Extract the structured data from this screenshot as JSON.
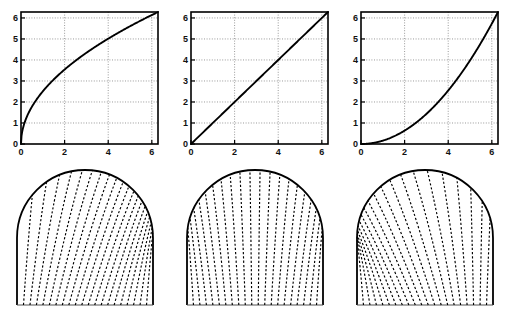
{
  "figure": {
    "title": "",
    "background": "#ffffff",
    "width": 510,
    "height": 323,
    "line_color": "#000000",
    "grid_color": "#808080",
    "axis_color": "#000000"
  },
  "top_row": {
    "panels": [
      {
        "name": "panel-top-left",
        "chart_data": {
          "type": "line",
          "title": "",
          "xlabel": "",
          "ylabel": "",
          "xlim": [
            0,
            6.2832
          ],
          "ylim": [
            0,
            6.2832
          ],
          "xticks": [
            0,
            2,
            4,
            6
          ],
          "yticks": [
            0,
            1,
            2,
            3,
            4,
            5,
            6
          ],
          "xticklabels": [
            "0",
            "2",
            "4",
            "6"
          ],
          "yticklabels": [
            "0",
            "1",
            "2",
            "3",
            "4",
            "5",
            "6"
          ],
          "grid": true,
          "grid_style": "dotted",
          "series": [
            {
              "name": "concave-map",
              "shape": "concave",
              "exponent": 0.5,
              "x": [
                0,
                0.3142,
                0.6283,
                0.9425,
                1.2566,
                1.5708,
                1.885,
                2.1991,
                2.5133,
                2.8274,
                3.1416,
                3.4558,
                3.7699,
                4.0841,
                4.3982,
                4.7124,
                5.0265,
                5.3407,
                5.6549,
                5.969,
                6.2832
              ],
              "y": [
                0,
                1.4,
                1.99,
                2.43,
                2.81,
                3.14,
                3.44,
                3.72,
                3.97,
                4.21,
                4.44,
                4.66,
                4.87,
                5.07,
                5.26,
                5.44,
                5.62,
                5.79,
                5.96,
                6.12,
                6.2832
              ]
            }
          ]
        }
      },
      {
        "name": "panel-top-middle",
        "chart_data": {
          "type": "line",
          "title": "",
          "xlabel": "",
          "ylabel": "",
          "xlim": [
            0,
            6.2832
          ],
          "ylim": [
            0,
            6.2832
          ],
          "xticks": [
            0,
            2,
            4,
            6
          ],
          "yticks": [
            0,
            1,
            2,
            3,
            4,
            5,
            6
          ],
          "xticklabels": [
            "0",
            "2",
            "4",
            "6"
          ],
          "yticklabels": [
            "0",
            "1",
            "2",
            "3",
            "4",
            "5",
            "6"
          ],
          "grid": true,
          "grid_style": "dotted",
          "series": [
            {
              "name": "identity-map",
              "shape": "linear",
              "exponent": 1,
              "x": [
                0,
                0.6283,
                1.2566,
                1.885,
                2.5133,
                3.1416,
                3.7699,
                4.3982,
                5.0265,
                5.6549,
                6.2832
              ],
              "y": [
                0,
                0.6283,
                1.2566,
                1.885,
                2.5133,
                3.1416,
                3.7699,
                4.3982,
                5.0265,
                5.6549,
                6.2832
              ]
            }
          ]
        }
      },
      {
        "name": "panel-top-right",
        "chart_data": {
          "type": "line",
          "title": "",
          "xlabel": "",
          "ylabel": "",
          "xlim": [
            0,
            6.2832
          ],
          "ylim": [
            0,
            6.2832
          ],
          "xticks": [
            0,
            2,
            4,
            6
          ],
          "yticks": [
            0,
            1,
            2,
            3,
            4,
            5,
            6
          ],
          "xticklabels": [
            "0",
            "2",
            "4",
            "6"
          ],
          "yticklabels": [
            "0",
            "1",
            "2",
            "3",
            "4",
            "5",
            "6"
          ],
          "grid": true,
          "grid_style": "dotted",
          "series": [
            {
              "name": "convex-map",
              "shape": "convex",
              "exponent": 2,
              "x": [
                0,
                0.3142,
                0.6283,
                0.9425,
                1.2566,
                1.5708,
                1.885,
                2.1991,
                2.5133,
                2.8274,
                3.1416,
                3.4558,
                3.7699,
                4.0841,
                4.3982,
                4.7124,
                5.0265,
                5.3407,
                5.6549,
                5.969,
                6.2832
              ],
              "y": [
                0,
                0.0157,
                0.0628,
                0.1414,
                0.2513,
                0.3927,
                0.5655,
                0.7697,
                1.0053,
                1.2723,
                1.5708,
                1.9006,
                2.2619,
                2.6546,
                3.0788,
                3.5343,
                4.0212,
                4.5396,
                5.0894,
                5.6706,
                6.2832
              ]
            }
          ]
        }
      }
    ]
  },
  "bottom_row": {
    "panels": [
      {
        "name": "panel-bottom-left",
        "diagram": {
          "type": "dome-grid",
          "description": "semicircular dome over vertical walls with dashed curvilinear grid lines converging at the right base",
          "line_style": "dashed",
          "outline_style": "solid",
          "num_grid_lines": 21,
          "convergence": "right",
          "exponent": 0.5
        }
      },
      {
        "name": "panel-bottom-middle",
        "diagram": {
          "type": "dome-grid",
          "description": "semicircular dome over vertical walls with evenly spaced dashed vertical grid lines",
          "line_style": "dashed",
          "outline_style": "solid",
          "num_grid_lines": 21,
          "convergence": "none",
          "exponent": 1
        }
      },
      {
        "name": "panel-bottom-right",
        "diagram": {
          "type": "dome-grid",
          "description": "semicircular dome over vertical walls with dashed curvilinear grid lines converging at the left base",
          "line_style": "dashed",
          "outline_style": "solid",
          "num_grid_lines": 21,
          "convergence": "left",
          "exponent": 2
        }
      }
    ]
  }
}
